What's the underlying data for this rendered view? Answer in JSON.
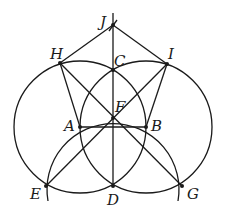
{
  "diagram": {
    "type": "geometric-construction",
    "points": {
      "A": {
        "label": "A",
        "x": 80,
        "y": 127
      },
      "B": {
        "label": "B",
        "x": 146,
        "y": 127
      },
      "C": {
        "label": "C",
        "x": 113,
        "y": 70
      },
      "D": {
        "label": "D",
        "x": 113,
        "y": 186
      },
      "E": {
        "label": "E",
        "x": 46,
        "y": 186
      },
      "F": {
        "label": "F",
        "x": 113,
        "y": 118
      },
      "G": {
        "label": "G",
        "x": 182,
        "y": 186
      },
      "H": {
        "label": "H",
        "x": 60,
        "y": 63
      },
      "I": {
        "label": "I",
        "x": 167,
        "y": 64
      },
      "J": {
        "label": "J",
        "x": 113,
        "y": 25
      }
    },
    "circles": [
      {
        "center": "A",
        "radius": 66
      },
      {
        "center": "B",
        "radius": 66
      },
      {
        "center": "D",
        "radius": 66,
        "arc": true
      }
    ],
    "segments": [
      "AB",
      "HA",
      "IB",
      "HJ",
      "IJ",
      "HG",
      "IE",
      "JD",
      "HI"
    ]
  }
}
